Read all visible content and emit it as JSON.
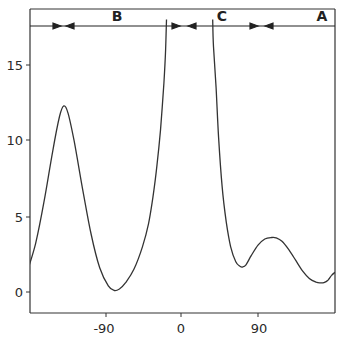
{
  "chart_data": {
    "type": "line",
    "title": "",
    "xlabel": "",
    "ylabel": "",
    "xlim": [
      -180,
      180
    ],
    "ylim": [
      -1.4,
      18
    ],
    "grid": false,
    "legend": null,
    "x_ticks": [
      -90,
      0,
      90
    ],
    "x_tick_labels": [
      "-90",
      "0",
      "90"
    ],
    "y_ticks": [
      0,
      5,
      10,
      15
    ],
    "y_tick_labels": [
      "0",
      "5",
      "10",
      "15"
    ],
    "series": [
      {
        "name": "curve",
        "x": [
          -180,
          -170,
          -160,
          -150,
          -142,
          -137,
          -132,
          -125,
          -115,
          -105,
          -95,
          -85,
          -78,
          -72,
          -65,
          -55,
          -45,
          -38,
          -33,
          -28,
          -24,
          -20,
          -18,
          -17,
          37,
          38,
          41,
          44,
          48,
          53,
          58,
          64,
          69,
          72,
          76,
          82,
          90,
          98,
          106,
          111,
          118,
          126,
          134,
          142,
          150,
          158,
          163,
          167,
          172,
          176,
          180
        ],
        "y": [
          1.3,
          3.2,
          6.0,
          9.3,
          11.6,
          12.3,
          11.8,
          10.0,
          6.8,
          3.8,
          1.6,
          0.4,
          0.1,
          0.2,
          0.6,
          1.5,
          3.0,
          4.5,
          6.2,
          8.4,
          10.7,
          13.8,
          16.0,
          18,
          18,
          16.2,
          13.5,
          10.2,
          7.0,
          4.6,
          3.0,
          2.0,
          1.7,
          1.65,
          1.8,
          2.4,
          3.1,
          3.5,
          3.6,
          3.58,
          3.35,
          2.8,
          2.1,
          1.4,
          0.9,
          0.65,
          0.6,
          0.62,
          0.8,
          1.1,
          1.3
        ]
      }
    ],
    "annotations": {
      "regions": [
        {
          "label": "B",
          "x_start": -180,
          "x_end": 0
        },
        {
          "label": "C",
          "x_start": 0,
          "x_end": 90
        },
        {
          "label": "A",
          "x_start": 90,
          "x_end": 180
        }
      ],
      "region_divider_x": [
        -140,
        0,
        90
      ]
    }
  },
  "labels": {
    "region_b": "B",
    "region_c": "C",
    "region_a": "A",
    "ytick_15": "15",
    "ytick_10": "10",
    "ytick_5": "5",
    "ytick_0": "0",
    "xtick_m90": "-90",
    "xtick_0": "0",
    "xtick_90": "90"
  }
}
